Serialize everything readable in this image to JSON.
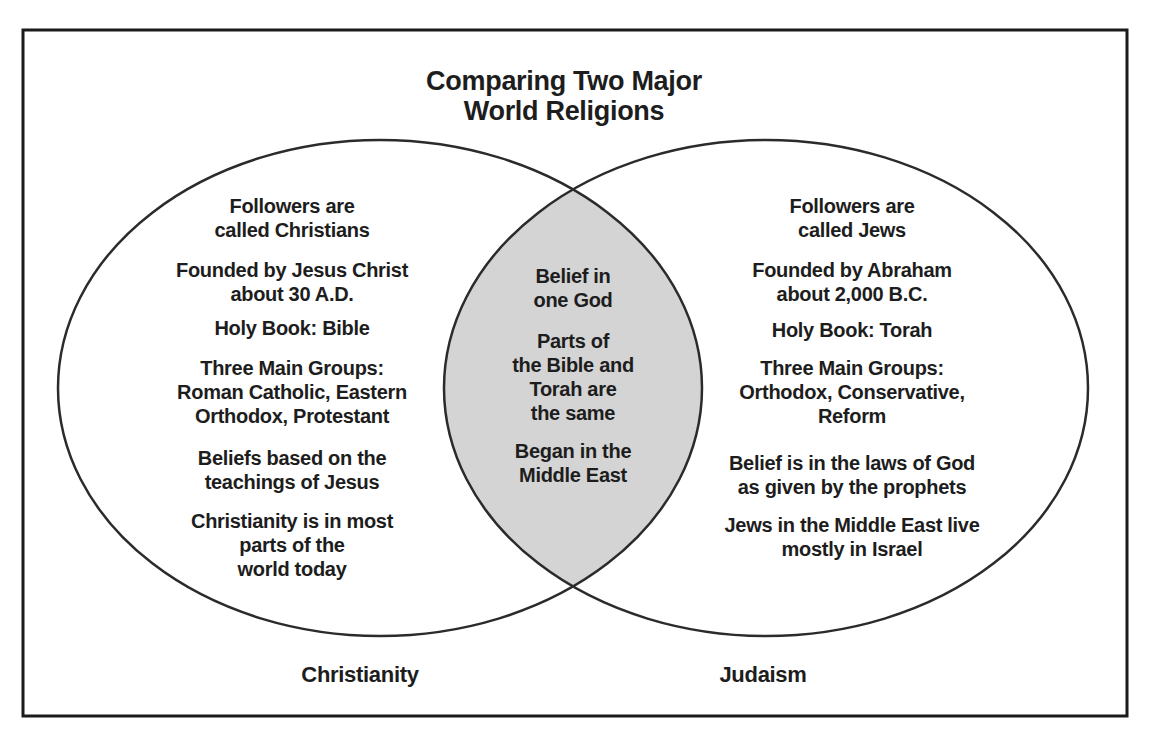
{
  "title": "Comparing Two Major\nWorld Religions",
  "venn": {
    "left": {
      "label": "Christianity",
      "items": [
        {
          "text": "Followers are\ncalled Christians"
        },
        {
          "text": "Founded by Jesus Christ\nabout 30 A.D."
        },
        {
          "text": "Holy Book: Bible"
        },
        {
          "text": "Three Main Groups:\nRoman Catholic, Eastern\nOrthodox, Protestant"
        },
        {
          "text": "Beliefs based on the\nteachings of Jesus"
        },
        {
          "text": "Christianity is in most\nparts of the\nworld today"
        }
      ]
    },
    "overlap": {
      "items": [
        {
          "text": "Belief in\none God"
        },
        {
          "text": "Parts of\nthe Bible and\nTorah are\nthe same"
        },
        {
          "text": "Began in the\nMiddle East"
        }
      ]
    },
    "right": {
      "label": "Judaism",
      "items": [
        {
          "text": "Followers are\ncalled Jews"
        },
        {
          "text": "Founded by Abraham\nabout 2,000 B.C."
        },
        {
          "text": "Holy Book: Torah"
        },
        {
          "text": "Three Main Groups:\nOrthodox, Conservative,\nReform"
        },
        {
          "text": "Belief is in the laws of God\nas given by the prophets"
        },
        {
          "text": "Jews in the Middle East live\nmostly in Israel"
        }
      ]
    }
  },
  "colors": {
    "overlap_fill": "#d4d4d4",
    "circle_stroke": "#2b2b2b",
    "border_stroke": "#1b1b1b",
    "text": "#1d1d1d"
  }
}
